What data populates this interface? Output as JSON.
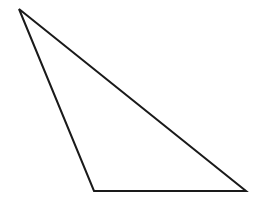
{
  "diagram": {
    "type": "triangle",
    "background": "#ffffff",
    "stroke_color": "#1a1a1a",
    "stroke_width": 2,
    "vertices": [
      {
        "name": "A",
        "x": 19,
        "y": 9
      },
      {
        "name": "B",
        "x": 94,
        "y": 191
      },
      {
        "name": "C",
        "x": 246,
        "y": 191
      }
    ],
    "points_attr": "19,9 94,191 246,191"
  }
}
